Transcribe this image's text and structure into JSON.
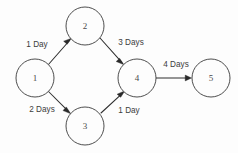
{
  "diagram": {
    "type": "activity-network-diagram",
    "title": "",
    "background_color": "#fdfdfd",
    "stroke_color": "#2e2e2e",
    "node_stroke_color": "#3a3a3a",
    "text_color": "#3c3c3c",
    "nodes": [
      {
        "id": "1",
        "label": "1",
        "cx": 35,
        "cy": 78,
        "r": 19
      },
      {
        "id": "2",
        "label": "2",
        "cx": 85,
        "cy": 26,
        "r": 19
      },
      {
        "id": "3",
        "label": "3",
        "cx": 85,
        "cy": 126,
        "r": 19
      },
      {
        "id": "4",
        "label": "4",
        "cx": 137,
        "cy": 78,
        "r": 19
      },
      {
        "id": "5",
        "label": "5",
        "cx": 211,
        "cy": 78,
        "r": 19
      }
    ],
    "edges": [
      {
        "id": "edge-1-2",
        "from": "1",
        "to": "2",
        "label": "1 Day",
        "label_x": 37,
        "label_y": 45,
        "x1": 48,
        "y1": 65,
        "x2": 70,
        "y2": 40
      },
      {
        "id": "edge-2-4",
        "from": "2",
        "to": "4",
        "label": "3 Days",
        "label_x": 131,
        "label_y": 43,
        "x1": 100,
        "y1": 38,
        "x2": 123,
        "y2": 63
      },
      {
        "id": "edge-1-3",
        "from": "1",
        "to": "3",
        "label": "2 Days",
        "label_x": 42,
        "label_y": 110,
        "x1": 48,
        "y1": 91,
        "x2": 70,
        "y2": 113
      },
      {
        "id": "edge-3-4",
        "from": "3",
        "to": "4",
        "label": "1 Day",
        "label_x": 129,
        "label_y": 111,
        "x1": 101,
        "y1": 113,
        "x2": 124,
        "y2": 92
      },
      {
        "id": "edge-4-5",
        "from": "4",
        "to": "5",
        "label": "4 Days",
        "label_x": 176,
        "label_y": 65,
        "x1": 156,
        "y1": 78,
        "x2": 191,
        "y2": 78
      }
    ]
  }
}
